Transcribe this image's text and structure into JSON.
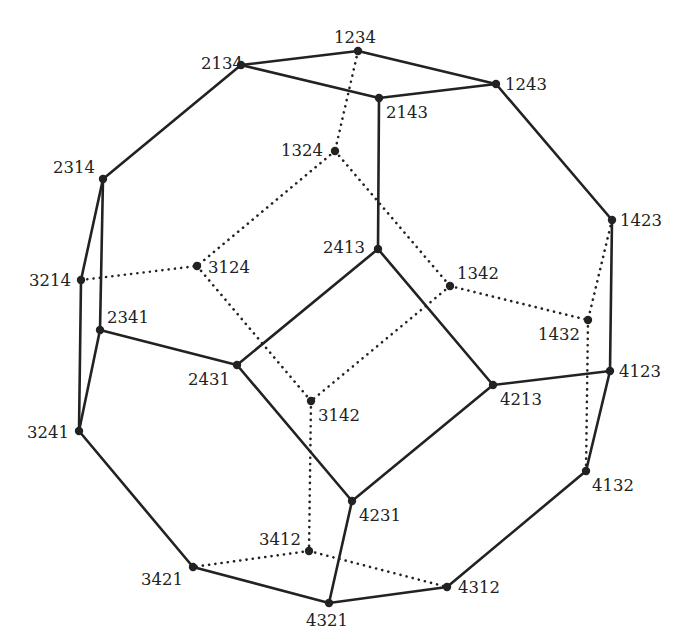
{
  "diagram": {
    "colors": {
      "stroke": "#222222",
      "background": "#ffffff"
    },
    "vertices": [
      {
        "id": "1234",
        "label": "1234",
        "x": 358,
        "y": 51,
        "lx": 334,
        "ly": 43,
        "anchor": "start"
      },
      {
        "id": "2134",
        "label": "2134",
        "x": 241,
        "y": 65,
        "lx": 201,
        "ly": 69,
        "anchor": "start"
      },
      {
        "id": "2143",
        "label": "2143",
        "x": 379,
        "y": 98,
        "lx": 386,
        "ly": 118,
        "anchor": "start"
      },
      {
        "id": "1243",
        "label": "1243",
        "x": 496,
        "y": 84,
        "lx": 505,
        "ly": 90,
        "anchor": "start"
      },
      {
        "id": "1324",
        "label": "1324",
        "x": 335,
        "y": 151,
        "lx": 281,
        "ly": 156,
        "anchor": "start"
      },
      {
        "id": "2314",
        "label": "2314",
        "x": 103,
        "y": 179,
        "lx": 53,
        "ly": 173,
        "anchor": "start"
      },
      {
        "id": "1423",
        "label": "1423",
        "x": 612,
        "y": 220,
        "lx": 620,
        "ly": 226,
        "anchor": "start"
      },
      {
        "id": "2413",
        "label": "2413",
        "x": 378,
        "y": 249,
        "lx": 323,
        "ly": 253,
        "anchor": "start"
      },
      {
        "id": "3124",
        "label": "3124",
        "x": 197,
        "y": 266,
        "lx": 208,
        "ly": 273,
        "anchor": "start"
      },
      {
        "id": "3214",
        "label": "3214",
        "x": 81,
        "y": 280,
        "lx": 29,
        "ly": 286,
        "anchor": "start"
      },
      {
        "id": "1342",
        "label": "1342",
        "x": 450,
        "y": 286,
        "lx": 457,
        "ly": 279,
        "anchor": "start"
      },
      {
        "id": "1432",
        "label": "1432",
        "x": 588,
        "y": 320,
        "lx": 538,
        "ly": 340,
        "anchor": "start"
      },
      {
        "id": "2341",
        "label": "2341",
        "x": 100,
        "y": 330,
        "lx": 107,
        "ly": 323,
        "anchor": "start"
      },
      {
        "id": "2431",
        "label": "2431",
        "x": 237,
        "y": 365,
        "lx": 188,
        "ly": 385,
        "anchor": "start"
      },
      {
        "id": "4123",
        "label": "4123",
        "x": 610,
        "y": 371,
        "lx": 619,
        "ly": 377,
        "anchor": "start"
      },
      {
        "id": "4213",
        "label": "4213",
        "x": 493,
        "y": 385,
        "lx": 500,
        "ly": 405,
        "anchor": "start"
      },
      {
        "id": "3142",
        "label": "3142",
        "x": 311,
        "y": 401,
        "lx": 318,
        "ly": 421,
        "anchor": "start"
      },
      {
        "id": "3241",
        "label": "3241",
        "x": 79,
        "y": 431,
        "lx": 27,
        "ly": 438,
        "anchor": "start"
      },
      {
        "id": "4132",
        "label": "4132",
        "x": 586,
        "y": 471,
        "lx": 592,
        "ly": 491,
        "anchor": "start"
      },
      {
        "id": "4231",
        "label": "4231",
        "x": 352,
        "y": 501,
        "lx": 359,
        "ly": 521,
        "anchor": "start"
      },
      {
        "id": "3412",
        "label": "3412",
        "x": 309,
        "y": 551,
        "lx": 259,
        "ly": 545,
        "anchor": "start"
      },
      {
        "id": "3421",
        "label": "3421",
        "x": 193,
        "y": 567,
        "lx": 141,
        "ly": 585,
        "anchor": "start"
      },
      {
        "id": "4312",
        "label": "4312",
        "x": 447,
        "y": 587,
        "lx": 458,
        "ly": 593,
        "anchor": "start"
      },
      {
        "id": "4321",
        "label": "4321",
        "x": 329,
        "y": 603,
        "lx": 306,
        "ly": 626,
        "anchor": "start"
      }
    ],
    "solid_edges": [
      [
        "2134",
        "1234"
      ],
      [
        "1234",
        "1243"
      ],
      [
        "2134",
        "2143"
      ],
      [
        "2143",
        "1243"
      ],
      [
        "2134",
        "2314"
      ],
      [
        "2143",
        "2413"
      ],
      [
        "1243",
        "1423"
      ],
      [
        "2314",
        "3214"
      ],
      [
        "2314",
        "2341"
      ],
      [
        "3214",
        "3241"
      ],
      [
        "2341",
        "3241"
      ],
      [
        "2341",
        "2431"
      ],
      [
        "2431",
        "2413"
      ],
      [
        "2413",
        "4213"
      ],
      [
        "2431",
        "4231"
      ],
      [
        "4213",
        "4231"
      ],
      [
        "4213",
        "4123"
      ],
      [
        "1423",
        "4123"
      ],
      [
        "4123",
        "4132"
      ],
      [
        "3241",
        "3421"
      ],
      [
        "3421",
        "4321"
      ],
      [
        "4231",
        "4321"
      ],
      [
        "4321",
        "4312"
      ],
      [
        "4312",
        "4132"
      ]
    ],
    "dotted_edges": [
      [
        "1234",
        "1324"
      ],
      [
        "1324",
        "3124"
      ],
      [
        "1324",
        "1342"
      ],
      [
        "3214",
        "3124"
      ],
      [
        "3124",
        "3142"
      ],
      [
        "1342",
        "3142"
      ],
      [
        "1342",
        "1432"
      ],
      [
        "1423",
        "1432"
      ],
      [
        "1432",
        "4132"
      ],
      [
        "3142",
        "3412"
      ],
      [
        "3412",
        "3421"
      ],
      [
        "3412",
        "4312"
      ]
    ]
  }
}
